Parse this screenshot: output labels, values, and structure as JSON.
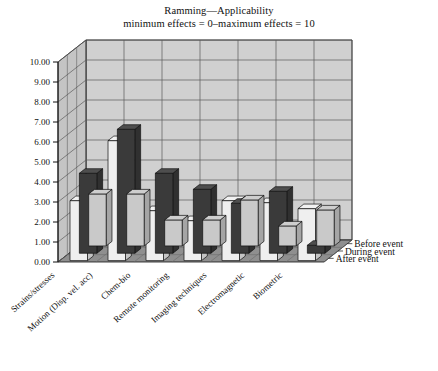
{
  "title": {
    "line1": "Ramming—Applicability",
    "line2": "minimum effects = 0–maximum effects = 10"
  },
  "axis": {
    "y_ticks": [
      "10.00",
      "9.00",
      "8.00",
      "7.00",
      "6.00",
      "5.00",
      "4.00",
      "3.00",
      "2.00",
      "1.00",
      "0.00"
    ]
  },
  "colors": {
    "bar_before": "#c9c9c9",
    "bar_during": "#3a3a3a",
    "bar_after": "#efefef",
    "wall": "#d0d0d0",
    "wall_side": "#c4c4c4",
    "floor": "#8f8f8f",
    "grid": "#5a5a5a",
    "outline": "#111111"
  },
  "chart_data": {
    "type": "bar",
    "title": "Ramming—Applicability",
    "subtitle": "minimum effects = 0–maximum effects = 10",
    "xlabel": "",
    "ylabel": "",
    "ylim": [
      0,
      10
    ],
    "ytick_step": 1,
    "grid": true,
    "legend_position": "right-depth-axis",
    "projection": "3d",
    "categories": [
      "Strains/stresses",
      "Motion (Disp. vel. acc)",
      "Chem-bio",
      "Remote monitoring",
      "Imaging techniques",
      "Electromagnetic",
      "Biometric"
    ],
    "series": [
      {
        "name": "Before event",
        "values": [
          2.6,
          2.6,
          1.3,
          1.3,
          2.3,
          1.0,
          1.8
        ]
      },
      {
        "name": "During event",
        "values": [
          4.0,
          6.2,
          4.0,
          3.2,
          2.5,
          3.1,
          0.4
        ]
      },
      {
        "name": "After event",
        "values": [
          3.0,
          6.0,
          2.5,
          2.0,
          3.0,
          2.9,
          2.6
        ]
      }
    ]
  }
}
